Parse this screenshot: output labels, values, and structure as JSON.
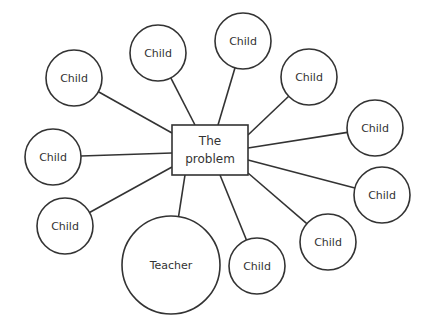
{
  "diagram": {
    "center": {
      "line1": "The",
      "line2": "problem",
      "x": 172,
      "y": 125,
      "w": 76,
      "h": 50
    },
    "nodes": [
      {
        "label": "Child",
        "cx": 158,
        "cy": 53,
        "r": 28,
        "ax": 195,
        "ay": 125
      },
      {
        "label": "Child",
        "cx": 243,
        "cy": 41,
        "r": 28,
        "ax": 218,
        "ay": 125
      },
      {
        "label": "Child",
        "cx": 309,
        "cy": 77,
        "r": 28,
        "ax": 248,
        "ay": 135
      },
      {
        "label": "Child",
        "cx": 74,
        "cy": 78,
        "r": 28,
        "ax": 172,
        "ay": 133
      },
      {
        "label": "Child",
        "cx": 375,
        "cy": 128,
        "r": 28,
        "ax": 248,
        "ay": 148
      },
      {
        "label": "Child",
        "cx": 53,
        "cy": 157,
        "r": 28,
        "ax": 172,
        "ay": 153
      },
      {
        "label": "Child",
        "cx": 382,
        "cy": 195,
        "r": 28,
        "ax": 248,
        "ay": 160
      },
      {
        "label": "Child",
        "cx": 65,
        "cy": 226,
        "r": 28,
        "ax": 172,
        "ay": 167
      },
      {
        "label": "Child",
        "cx": 328,
        "cy": 242,
        "r": 28,
        "ax": 248,
        "ay": 173
      },
      {
        "label": "Child",
        "cx": 257,
        "cy": 266,
        "r": 28,
        "ax": 220,
        "ay": 175
      },
      {
        "label": "Teacher",
        "cx": 171,
        "cy": 265,
        "r": 49,
        "ax": 185,
        "ay": 175
      }
    ]
  },
  "colors": {
    "stroke": "#333333",
    "text": "#333333",
    "background": "#ffffff"
  }
}
